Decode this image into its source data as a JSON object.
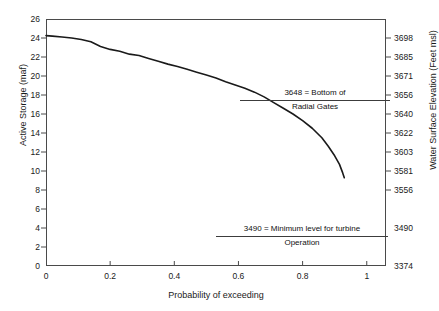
{
  "chart_data": {
    "type": "line",
    "title": "",
    "xlabel": "Probability of exceeding",
    "ylabel": "Active Storage (maf)",
    "y2label": "Water Surface Elevation (Feet msl)",
    "xlim": [
      0,
      1.06
    ],
    "ylim": [
      0,
      26
    ],
    "grid": false,
    "legend": null,
    "xticks": [
      "0",
      "0.2",
      "0.4",
      "0.6",
      "0.8",
      "1"
    ],
    "xtick_values": [
      0,
      0.2,
      0.4,
      0.6,
      0.8,
      1
    ],
    "yticks": [
      "0",
      "2",
      "4",
      "6",
      "8",
      "10",
      "12",
      "14",
      "16",
      "18",
      "20",
      "22",
      "24",
      "26"
    ],
    "ytick_values": [
      0,
      2,
      4,
      6,
      8,
      10,
      12,
      14,
      16,
      18,
      20,
      22,
      24,
      26
    ],
    "y2ticks": [
      "3698",
      "3685",
      "3671",
      "3656",
      "3640",
      "3622",
      "3603",
      "3581",
      "3556",
      "3490",
      "3374"
    ],
    "y2tick_storage": [
      24,
      22,
      20,
      18,
      16,
      14,
      12,
      10,
      8,
      4,
      0
    ],
    "series": [
      {
        "name": "Active Storage exceedance",
        "x": [
          0.0,
          0.02,
          0.05,
          0.08,
          0.11,
          0.14,
          0.17,
          0.2,
          0.23,
          0.26,
          0.29,
          0.32,
          0.35,
          0.38,
          0.41,
          0.44,
          0.47,
          0.5,
          0.53,
          0.56,
          0.59,
          0.62,
          0.65,
          0.68,
          0.71,
          0.74,
          0.77,
          0.8,
          0.83,
          0.86,
          0.88,
          0.9,
          0.915,
          0.925,
          0.93
        ],
        "values": [
          24.25,
          24.2,
          24.1,
          24.0,
          23.85,
          23.6,
          23.1,
          22.8,
          22.6,
          22.3,
          22.15,
          21.85,
          21.55,
          21.25,
          21.0,
          20.7,
          20.4,
          20.1,
          19.8,
          19.4,
          19.05,
          18.7,
          18.3,
          17.8,
          17.2,
          16.6,
          16.0,
          15.3,
          14.5,
          13.5,
          12.6,
          11.6,
          10.7,
          9.8,
          9.3
        ]
      }
    ],
    "annotations": [
      {
        "name": "bottom-of-radial-gates",
        "line1": "3648 = Bottom of",
        "line2": "Radial Gates",
        "value": 3648
      },
      {
        "name": "minimum-turbine-level",
        "line1": "3490 = Minimum level for turbine",
        "line2": "Operation",
        "value": 3490
      }
    ],
    "colors": {
      "curve": "#1a1a1a",
      "axis": "#4a4a4a",
      "text": "#1a1a1a",
      "background": "#ffffff"
    }
  }
}
